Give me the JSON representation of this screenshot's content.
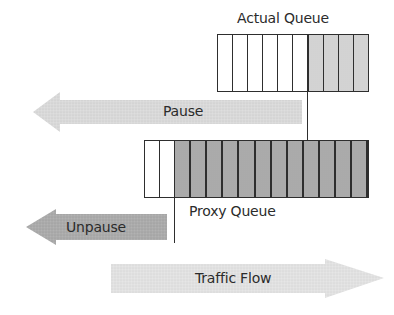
{
  "diagram": {
    "actual_queue": {
      "label": "Actual Queue",
      "cells": [
        "empty",
        "empty",
        "empty",
        "empty",
        "empty",
        "empty",
        "light",
        "light",
        "light",
        "light"
      ],
      "empty_count": 6,
      "filled_count": 4
    },
    "proxy_queue": {
      "label": "Proxy Queue",
      "cells": [
        "empty",
        "empty",
        "dark",
        "dark",
        "dark",
        "dark",
        "dark",
        "dark",
        "dark",
        "dark",
        "dark",
        "dark",
        "dark",
        "dark"
      ],
      "empty_count": 2,
      "filled_count": 12
    },
    "arrows": {
      "pause": {
        "label": "Pause",
        "direction": "left",
        "fill": "#d6d6d6"
      },
      "unpause": {
        "label": "Unpause",
        "direction": "left",
        "fill": "#a8a8a8"
      },
      "traffic_flow": {
        "label": "Traffic Flow",
        "direction": "right",
        "fill": "#e0e0e0"
      }
    },
    "colors": {
      "outline": "#2e2e2e",
      "empty_cell": "#ffffff",
      "actual_filled_cell": "#dcdcdc",
      "proxy_filled_cell": "#b4b4b4",
      "text": "#2b2b2b"
    }
  }
}
